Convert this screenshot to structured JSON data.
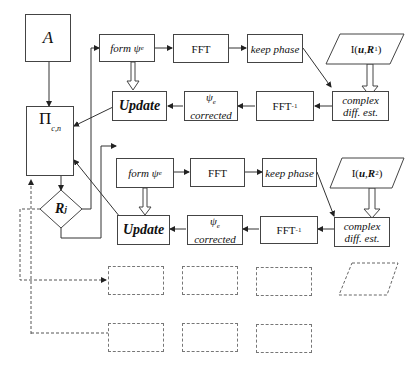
{
  "diagram": {
    "input_node": "A",
    "projection_node": "Π",
    "projection_sub": "c,n",
    "decision_node": "R",
    "decision_sub": "j",
    "rows": [
      {
        "form": "form ψ",
        "form_sub": "e",
        "fft": "FFT",
        "keep_phase": "keep phase",
        "intensity_a": "I(",
        "intensity_u": "u",
        "intensity_sep": ", ",
        "intensity_R": "R",
        "intensity_R_sub": "1",
        "intensity_close": ")",
        "complex_line1": "complex",
        "complex_line2": "diff. est.",
        "ifft": "FFT",
        "ifft_sup": "-1",
        "corrected_psi": "ψ",
        "corrected_psi_sub": "e",
        "corrected_word": "corrected",
        "update": "Update"
      },
      {
        "form": "form ψ",
        "form_sub": "e",
        "fft": "FFT",
        "keep_phase": "keep phase",
        "intensity_a": "I(",
        "intensity_u": "u",
        "intensity_sep": ", ",
        "intensity_R": "R",
        "intensity_R_sub": "2",
        "intensity_close": ")",
        "complex_line1": "complex",
        "complex_line2": "diff. est.",
        "ifft": "FFT",
        "ifft_sup": "-1",
        "corrected_psi": "ψ",
        "corrected_psi_sub": "e",
        "corrected_word": "corrected",
        "update": "Update"
      }
    ],
    "placeholder_rows": 2
  }
}
